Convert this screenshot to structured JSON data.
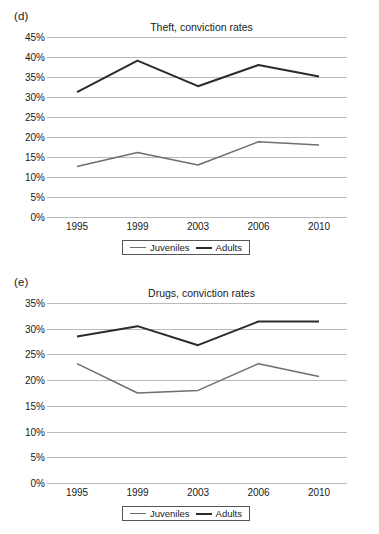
{
  "figure": {
    "background": "#ffffff",
    "panels": [
      {
        "id": "d",
        "panel_label": "(d)",
        "chart_data": {
          "type": "line",
          "title": "Theft, conviction rates",
          "xlabel": "",
          "ylabel": "",
          "x": [
            "1995",
            "1999",
            "2003",
            "2006",
            "2010"
          ],
          "categories": [
            "1995",
            "1999",
            "2003",
            "2006",
            "2010"
          ],
          "ylim": [
            0,
            45
          ],
          "ytick_labels": [
            "0%",
            "5%",
            "10%",
            "15%",
            "20%",
            "25%",
            "30%",
            "35%",
            "40%",
            "45%"
          ],
          "ytick_values": [
            0,
            5,
            10,
            15,
            20,
            25,
            30,
            35,
            40,
            45
          ],
          "grid": true,
          "legend_position": "bottom-center",
          "series": [
            {
              "name": "Juveniles",
              "color": "#6e6e6e",
              "line_width": 1.5,
              "values": [
                12.6,
                16.1,
                13.0,
                18.8,
                18.0
              ]
            },
            {
              "name": "Adults",
              "color": "#2b2b2b",
              "line_width": 2,
              "values": [
                31.2,
                39.1,
                32.7,
                38.0,
                35.1
              ]
            }
          ]
        }
      },
      {
        "id": "e",
        "panel_label": "(e)",
        "chart_data": {
          "type": "line",
          "title": "Drugs, conviction rates",
          "xlabel": "",
          "ylabel": "",
          "x": [
            "1995",
            "1999",
            "2003",
            "2006",
            "2010"
          ],
          "categories": [
            "1995",
            "1999",
            "2003",
            "2006",
            "2010"
          ],
          "ylim": [
            0,
            35
          ],
          "ytick_labels": [
            "0%",
            "5%",
            "10%",
            "15%",
            "20%",
            "25%",
            "30%",
            "35%"
          ],
          "ytick_values": [
            0,
            5,
            10,
            15,
            20,
            25,
            30,
            35
          ],
          "grid": true,
          "legend_position": "bottom-center",
          "series": [
            {
              "name": "Juveniles",
              "color": "#6e6e6e",
              "line_width": 1.5,
              "values": [
                23.2,
                17.5,
                18.0,
                23.2,
                20.7
              ]
            },
            {
              "name": "Adults",
              "color": "#2b2b2b",
              "line_width": 2,
              "values": [
                28.5,
                30.5,
                26.8,
                31.4,
                31.4
              ]
            }
          ]
        }
      }
    ]
  }
}
